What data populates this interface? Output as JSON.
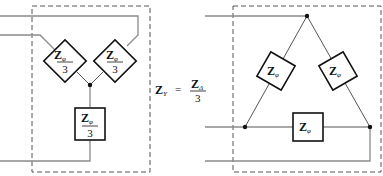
{
  "diagram": {
    "wye_circuit": {
      "label": "Wye (Y) equivalent",
      "impedances": [
        {
          "name": "Z",
          "subscript": "φ",
          "denominator": "3"
        },
        {
          "name": "Z",
          "subscript": "φ",
          "denominator": "3"
        },
        {
          "name": "Z",
          "subscript": "φ",
          "denominator": "3"
        }
      ]
    },
    "equation": {
      "lhs": "Z",
      "lhs_subscript": "Y",
      "equals": "=",
      "rhs_num": "Z",
      "rhs_num_subscript": "Δ",
      "rhs_den": "3"
    },
    "delta_circuit": {
      "label": "Delta (Δ) configuration",
      "impedances": [
        {
          "name": "Z",
          "subscript": "φ"
        },
        {
          "name": "Z",
          "subscript": "φ"
        },
        {
          "name": "Z",
          "subscript": "φ"
        }
      ]
    },
    "colors": {
      "wire": "#8a8a8a",
      "box": "#111111",
      "dashed_border": "#555555"
    }
  }
}
